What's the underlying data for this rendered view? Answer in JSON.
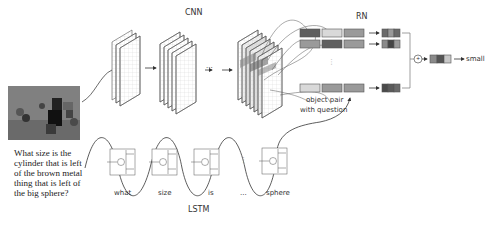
{
  "modules": {
    "cnn_label": "CNN",
    "rn_label": "RN",
    "lstm_label": "LSTM"
  },
  "question": "What size is the cylinder that is left of the brown metal thing that is left of the big sphere?",
  "rn": {
    "object_pair_label": "object pair",
    "with_question_label": "with question",
    "sum_symbol": "+",
    "output_answer": "small",
    "ellipsis": "⋮"
  },
  "cnn": {
    "ellipsis": "···"
  },
  "lstm": {
    "words": [
      "what",
      "size",
      "is",
      "...",
      "sphere"
    ],
    "ellipsis": "⋮"
  },
  "colors": {
    "dark_gray": "#5f5f5f",
    "mid_gray": "#9a9a9a",
    "light_gray": "#d9d9d9",
    "line": "#444444"
  }
}
